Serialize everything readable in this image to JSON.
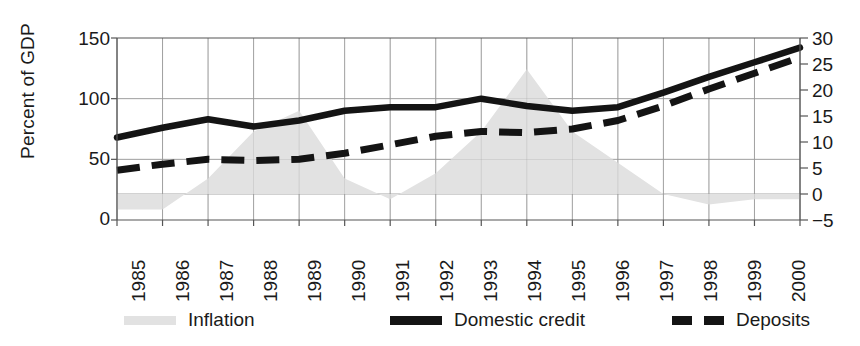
{
  "chart_data": {
    "type": "area",
    "title": "",
    "xlabel": "",
    "ylabel": "Percent of GDP",
    "ylabel_right": "",
    "grid": true,
    "legend_position": "bottom",
    "x": [
      1985,
      1986,
      1987,
      1988,
      1989,
      1990,
      1991,
      1992,
      1993,
      1994,
      1995,
      1996,
      1997,
      1998,
      1999,
      2000
    ],
    "categories": [
      "1985",
      "1986",
      "1987",
      "1988",
      "1989",
      "1990",
      "1991",
      "1992",
      "1993",
      "1994",
      "1995",
      "1996",
      "1997",
      "1998",
      "1999",
      "2000"
    ],
    "ylim": [
      0,
      150
    ],
    "yticks": [
      0,
      50,
      100,
      150
    ],
    "ylim_right": [
      -5,
      30
    ],
    "yticks_right": [
      -5,
      0,
      5,
      10,
      15,
      20,
      25,
      30
    ],
    "series": [
      {
        "name": "Inflation",
        "type": "area",
        "axis": "right",
        "color": "#e2e2e2",
        "values": [
          -3,
          -3,
          3,
          12,
          16,
          3,
          -1,
          4,
          12,
          24,
          12,
          6,
          0,
          -2,
          -1,
          -1
        ]
      },
      {
        "name": "Domestic credit",
        "type": "line",
        "style": "solid",
        "axis": "left",
        "color": "#141414",
        "values": [
          68,
          76,
          83,
          77,
          82,
          90,
          93,
          93,
          100,
          94,
          90,
          93,
          105,
          118,
          130,
          142
        ]
      },
      {
        "name": "Deposits",
        "type": "line",
        "style": "dashed",
        "axis": "left",
        "color": "#141414",
        "values": [
          41,
          46,
          50,
          49,
          50,
          55,
          62,
          69,
          73,
          72,
          75,
          82,
          94,
          108,
          121,
          134
        ]
      }
    ]
  },
  "axes": {
    "left_label": "Percent of GDP",
    "left_ticks": [
      "150",
      "100",
      "50",
      "0"
    ],
    "right_ticks": [
      "30",
      "25",
      "20",
      "15",
      "10",
      "5",
      "0",
      "−5"
    ],
    "x_ticks": [
      "1985",
      "1986",
      "1987",
      "1988",
      "1989",
      "1990",
      "1991",
      "1992",
      "1993",
      "1994",
      "1995",
      "1996",
      "1997",
      "1998",
      "1999",
      "2000"
    ]
  },
  "legend": {
    "items": [
      {
        "label": "Inflation",
        "swatch": "area-swatch",
        "color": "#e2e2e2"
      },
      {
        "label": "Domestic credit",
        "swatch": "solid-line-swatch",
        "color": "#141414"
      },
      {
        "label": "Deposits",
        "swatch": "dashed-line-swatch",
        "color": "#141414"
      }
    ]
  },
  "colors": {
    "area": "#e2e2e2",
    "line": "#141414",
    "grid": "#9a9a9a",
    "axis": "#4a4a4a",
    "text": "#1a1a1a",
    "background": "#ffffff"
  }
}
